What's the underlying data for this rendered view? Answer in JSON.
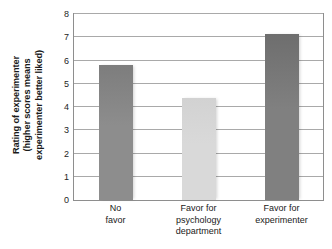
{
  "chart_data": {
    "type": "bar",
    "title": "",
    "subtitle": "",
    "xlabel": "",
    "ylabel_lines": [
      "Rating of experimenter",
      "(higher scores means",
      "experimenter better liked)"
    ],
    "ylabel": "Rating of experimenter (higher scores means experimenter better liked)",
    "categories": [
      "No favor",
      "Favor for psychology department",
      "Favor for experimenter"
    ],
    "category_lines": [
      [
        "No",
        "favor"
      ],
      [
        "Favor for",
        "psychology",
        "department"
      ],
      [
        "Favor for",
        "experimenter"
      ]
    ],
    "values": [
      5.8,
      4.4,
      7.15
    ],
    "bar_colors": [
      "#8d8d8d",
      "#d9d9d9",
      "#808080"
    ],
    "bar_colors_top": [
      "#7d7d7d",
      "#d2d2d2",
      "#6e6e6e"
    ],
    "ylim": [
      0,
      8
    ],
    "ytick_labels": [
      "0",
      "1",
      "2",
      "3",
      "4",
      "5",
      "6",
      "7",
      "8"
    ],
    "ytick_values": [
      0,
      1,
      2,
      3,
      4,
      5,
      6,
      7,
      8
    ],
    "grid": true,
    "grid_axis": "y",
    "legend": false,
    "legend_position": "none",
    "axis_color": "#8e8e8e",
    "grid_color": "#a9a9a9",
    "background": "#ffffff"
  }
}
